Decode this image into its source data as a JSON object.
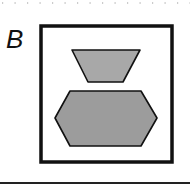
{
  "panel": {
    "label": "B"
  },
  "figure": {
    "frame": {
      "x": 41,
      "y": 26,
      "width": 131,
      "height": 136,
      "stroke": "#111111",
      "stroke_width": 3.5
    },
    "shapes": [
      {
        "name": "trapezoid",
        "points": "72,50 140,50 123,82 88,82",
        "fill": "#a8a8a8",
        "stroke": "#111111"
      },
      {
        "name": "hexagon",
        "points": "70,91 141,91 157,118 141,146 70,146 55,118",
        "fill": "#9c9c9c",
        "stroke": "#111111"
      }
    ]
  },
  "colors": {
    "frame": "#111111",
    "shape_fill": "#a0a0a0",
    "dots": "#999999",
    "rule": "#222222"
  }
}
